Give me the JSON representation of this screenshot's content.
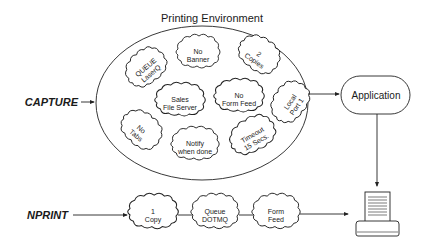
{
  "diagram": {
    "title": "Printing Environment",
    "inputs": {
      "capture": "CAPTURE",
      "nprint": "NPRINT"
    },
    "application": "Application",
    "environment_settings": [
      {
        "line1": "QUEUE",
        "line2": "LaserQ"
      },
      {
        "line1": "No",
        "line2": "Banner"
      },
      {
        "line1": "2",
        "line2": "Copies"
      },
      {
        "line1": "Sales",
        "line2": "File Server"
      },
      {
        "line1": "No",
        "line2": "Form Feed"
      },
      {
        "line1": "Local",
        "line2": "Port 1"
      },
      {
        "line1": "No",
        "line2": "Tabs"
      },
      {
        "line1": "Notify",
        "line2": "when done"
      },
      {
        "line1": "Timeout",
        "line2": "15 Secs."
      }
    ],
    "nprint_chain": [
      {
        "line1": "1",
        "line2": "Copy"
      },
      {
        "line1": "Queue",
        "line2": "DOTMQ"
      },
      {
        "line1": "Form",
        "line2": "Feed"
      }
    ],
    "output_device": "printer-icon",
    "colors": {
      "line": "#222222",
      "background": "#ffffff"
    }
  }
}
